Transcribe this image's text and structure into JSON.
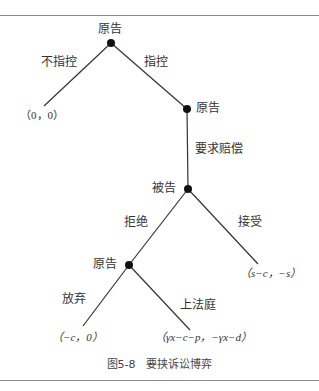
{
  "figure": {
    "caption": "图5-8　要挟诉讼博弈",
    "line_color": "#333333",
    "node_color": "#111111"
  },
  "nodes": {
    "root": {
      "label": "原告",
      "x": 111,
      "y": 43
    },
    "plaintiff2": {
      "label": "原告",
      "x": 187,
      "y": 109
    },
    "defendant": {
      "label": "被告",
      "x": 188,
      "y": 189
    },
    "plaintiff3": {
      "label": "原告",
      "x": 129,
      "y": 265
    }
  },
  "edges": {
    "not_accuse": {
      "label": "不指控"
    },
    "accuse": {
      "label": "指控"
    },
    "demand": {
      "label": "要求赔偿"
    },
    "refuse": {
      "label": "拒绝"
    },
    "accept": {
      "label": "接受"
    },
    "abandon": {
      "label": "放弃"
    },
    "court": {
      "label": "上法庭"
    }
  },
  "payoffs": {
    "not_accuse": "（0，0）",
    "accept": "（s−c，−s）",
    "abandon": "（−c，0）",
    "court": "（γx−c−p，−γx−d）"
  }
}
